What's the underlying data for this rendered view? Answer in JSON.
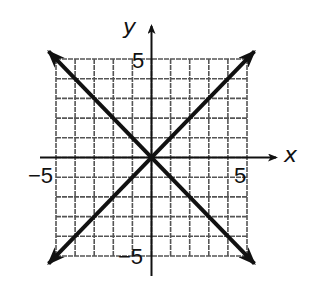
{
  "chart_data": {
    "type": "line",
    "title": "",
    "xlabel": "x",
    "ylabel": "y",
    "xlim": [
      -5,
      5
    ],
    "ylim": [
      -5,
      5
    ],
    "grid": true,
    "grid_step": 1,
    "tick_labels": {
      "x_neg": "−5",
      "x_pos": "5",
      "y_pos": "5",
      "y_neg": "−5"
    },
    "series": [
      {
        "name": "y = x",
        "x": [
          -5,
          5
        ],
        "y": [
          -5,
          5
        ],
        "arrows": "both"
      },
      {
        "name": "y = -x",
        "x": [
          -5,
          5
        ],
        "y": [
          5,
          -5
        ],
        "arrows": "both"
      }
    ],
    "legend": null
  },
  "colors": {
    "line": "#111111",
    "grid": "#555555",
    "background": "#ffffff"
  }
}
